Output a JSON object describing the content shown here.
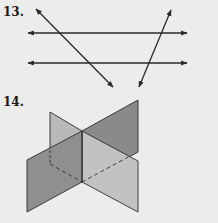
{
  "problems": [
    {
      "number": "13.",
      "figure": "two-parallel-lines-cut-by-two-transversals"
    },
    {
      "number": "14.",
      "figure": "two-intersecting-planes"
    }
  ],
  "colors": {
    "background": "#ececea",
    "line": "#2a2a2a",
    "plane_dark": "#8c8c8c",
    "plane_light": "#bdbdbd",
    "plane_edge": "#2e2e2e"
  }
}
